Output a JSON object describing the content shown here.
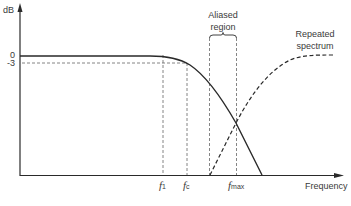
{
  "diagram": {
    "y_axis_label": "dB",
    "x_axis_label": "Frequency",
    "y_ticks": [
      {
        "label": "0",
        "value": 0
      },
      {
        "label": "-3",
        "value": -3
      }
    ],
    "x_markers": [
      {
        "symbol": "f",
        "subscript": "1",
        "id": "f1"
      },
      {
        "symbol": "f",
        "subscript": "c",
        "id": "fc"
      },
      {
        "symbol": "f",
        "subscript": "max",
        "id": "fmax"
      }
    ],
    "annotations": {
      "aliased_region_line1": "Aliased",
      "aliased_region_line2": "region",
      "repeated_spectrum_line1": "Repeated",
      "repeated_spectrum_line2": "spectrum"
    },
    "curves": [
      {
        "name": "Filter response",
        "style": "solid"
      },
      {
        "name": "Repeated spectrum",
        "style": "dashed"
      }
    ],
    "colors": {
      "line": "#2a2a2a",
      "dashed": "#555555",
      "text": "#3a3a3a"
    }
  }
}
